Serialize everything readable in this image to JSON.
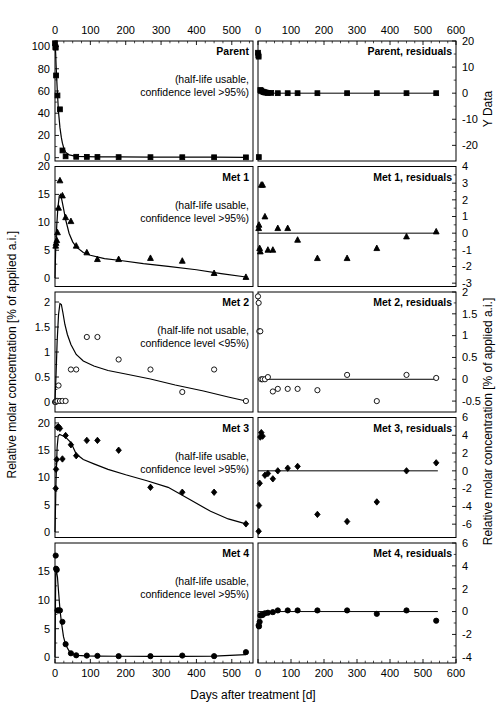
{
  "figure": {
    "xlabel": "Days after treatment [d]",
    "ylabel_left": "Relative molar concentration [% of applied a.i.]",
    "ylabel_right_top": "Y Data",
    "ylabel_right": "Relative molar concentration [% of applied a.i.]",
    "note_usable": "(half-life usable,",
    "note_usable2": "confidence level >95%)",
    "note_notusable": "(half-life not usable,",
    "note_notusable2": "confidence level <95%)",
    "xticks_left": [
      "0",
      "100",
      "200",
      "300",
      "400",
      "500"
    ],
    "xticks_right": [
      "0",
      "100",
      "200",
      "300",
      "400",
      "500",
      "600"
    ],
    "xlim_left": [
      0,
      560
    ],
    "xlim_right": [
      0,
      600
    ]
  },
  "chart_data": [
    {
      "type": "scatter",
      "id": "parent",
      "title": "Parent",
      "note": "(half-life usable, confidence level >95%)",
      "marker": "square",
      "filled": true,
      "xlabel": "Days after treatment [d]",
      "ylabel": "Relative molar concentration [% of applied a.i.]",
      "xlim": [
        0,
        560
      ],
      "ylim": [
        -3,
        105
      ],
      "yticks": [
        0,
        20,
        40,
        60,
        80,
        100
      ],
      "x": [
        0,
        1,
        2,
        3,
        7,
        14,
        21,
        30,
        60,
        90,
        120,
        180,
        270,
        360,
        450,
        540
      ],
      "y": [
        103,
        99.5,
        99,
        74,
        56,
        43.5,
        6.5,
        1.2,
        0.8,
        0.7,
        0.6,
        0.5,
        0.45,
        0.4,
        0.35,
        0.3
      ],
      "fit_x": [
        0,
        1,
        2,
        3,
        5,
        7,
        10,
        14,
        18,
        21,
        25,
        30,
        40,
        60,
        90,
        120,
        180,
        270,
        360,
        450,
        540
      ],
      "fit_y": [
        103,
        99,
        93,
        84,
        70,
        57,
        41,
        27,
        18,
        13,
        8.5,
        5,
        2.5,
        1.2,
        0.9,
        0.8,
        0.65,
        0.55,
        0.5,
        0.42,
        0.35
      ]
    },
    {
      "type": "scatter",
      "id": "parent-residuals",
      "title": "Parent, residuals",
      "marker": "square",
      "filled": true,
      "ylabel": "Y Data",
      "xlim": [
        0,
        600
      ],
      "ylim": [
        -26,
        20
      ],
      "yticks": [
        20,
        10,
        0,
        -10,
        -20
      ],
      "x": [
        0,
        1,
        2,
        2.5,
        7,
        10,
        14,
        18,
        21,
        25,
        30,
        40,
        60,
        90,
        120,
        180,
        270,
        360,
        450,
        540
      ],
      "y": [
        15.5,
        14.5,
        14,
        -24.5,
        1.2,
        1.0,
        0.6,
        0.4,
        0.3,
        0.2,
        0.1,
        0.1,
        0,
        0,
        0,
        0,
        0,
        0,
        0,
        0
      ],
      "zero_line": 0
    },
    {
      "type": "scatter",
      "id": "met1",
      "title": "Met 1",
      "note": "(half-life usable, confidence level >95%)",
      "marker": "triangle",
      "filled": true,
      "ylabel": "Relative molar concentration [% of applied a.i.]",
      "xlim": [
        0,
        560
      ],
      "ylim": [
        -1.5,
        20
      ],
      "yticks": [
        20,
        15,
        10,
        5,
        0
      ],
      "x": [
        2,
        3,
        5,
        7,
        10,
        14,
        21,
        30,
        45,
        60,
        90,
        120,
        180,
        270,
        360,
        450,
        540
      ],
      "y": [
        5.8,
        6.3,
        6.8,
        8.2,
        12.6,
        17.5,
        14.8,
        10.9,
        10.2,
        5.8,
        4.6,
        3.4,
        3.4,
        3.6,
        3.1,
        0.9,
        0.2
      ],
      "fit_x": [
        0,
        2,
        5,
        8,
        12,
        16,
        20,
        25,
        30,
        40,
        50,
        60,
        80,
        100,
        140,
        180,
        250,
        320,
        400,
        470,
        540
      ],
      "fit_y": [
        0,
        5.5,
        9.5,
        12.5,
        14.7,
        15.0,
        13.8,
        12.2,
        10.5,
        8.0,
        6.5,
        5.6,
        4.6,
        4.1,
        3.5,
        3.2,
        2.6,
        2.1,
        1.5,
        0.8,
        0.2
      ],
      "zero_line": 0
    },
    {
      "type": "scatter",
      "id": "met1-residuals",
      "title": "Met 1, residuals",
      "marker": "triangle",
      "filled": true,
      "xlim": [
        0,
        600
      ],
      "ylim": [
        -3.2,
        4
      ],
      "yticks": [
        4,
        3,
        2,
        1,
        0,
        -1,
        -2,
        -3
      ],
      "x": [
        2,
        3,
        5,
        7,
        10,
        14,
        21,
        30,
        45,
        60,
        90,
        120,
        180,
        270,
        360,
        450,
        540
      ],
      "y": [
        0.3,
        0.5,
        -0.9,
        -1.1,
        2.9,
        2.9,
        1.0,
        -1.0,
        -1.0,
        0.3,
        0.3,
        -0.4,
        -1.5,
        -1.5,
        -0.9,
        -0.2,
        0.1
      ],
      "zero_line": 0
    },
    {
      "type": "scatter",
      "id": "met2",
      "title": "Met 2",
      "note": "(half-life not usable, confidence level <95%)",
      "marker": "circle",
      "filled": false,
      "ylabel": "Relative molar concentration [% of applied a.i.]",
      "xlim": [
        0,
        560
      ],
      "ylim": [
        -0.2,
        2.2
      ],
      "yticks": [
        2.0,
        1.5,
        1.0,
        0.5,
        0.0
      ],
      "x": [
        0,
        2,
        4,
        7,
        10,
        14,
        21,
        30,
        45,
        60,
        90,
        120,
        180,
        270,
        360,
        450,
        540
      ],
      "y": [
        0.0,
        0.0,
        0.02,
        0.02,
        0.33,
        0.02,
        0.02,
        0.02,
        0.65,
        0.65,
        1.3,
        1.3,
        0.85,
        0.65,
        0.2,
        0.65,
        0.02
      ],
      "fit_x": [
        0,
        3,
        6,
        10,
        14,
        18,
        22,
        28,
        35,
        45,
        60,
        80,
        110,
        150,
        200,
        270,
        340,
        420,
        490,
        540
      ],
      "fit_y": [
        0.02,
        0.55,
        1.2,
        1.75,
        1.97,
        1.95,
        1.8,
        1.55,
        1.35,
        1.15,
        0.95,
        0.82,
        0.72,
        0.63,
        0.56,
        0.46,
        0.34,
        0.22,
        0.1,
        0.02
      ],
      "zero_line": 0
    },
    {
      "type": "scatter",
      "id": "met2-residuals",
      "title": "Met 2, residuals",
      "marker": "circle",
      "filled": false,
      "xlim": [
        0,
        600
      ],
      "ylim": [
        -0.75,
        2.0
      ],
      "yticks": [
        2.0,
        1.5,
        1.0,
        0.5,
        0.0,
        -0.5
      ],
      "x": [
        0,
        2,
        4,
        7,
        10,
        14,
        21,
        30,
        45,
        60,
        90,
        120,
        180,
        270,
        360,
        450,
        540
      ],
      "y": [
        1.9,
        1.75,
        1.1,
        1.1,
        0.0,
        0.0,
        0.0,
        0.05,
        -0.28,
        -0.22,
        -0.22,
        -0.22,
        -0.25,
        0.1,
        -0.5,
        0.1,
        0.03
      ],
      "zero_line": 0
    },
    {
      "type": "scatter",
      "id": "met3",
      "title": "Met 3",
      "note": "(half-life usable, confidence level >95%)",
      "marker": "diamond",
      "filled": true,
      "ylabel": "Relative molar concentration [% of applied a.i.]",
      "xlim": [
        0,
        560
      ],
      "ylim": [
        -1,
        21
      ],
      "yticks": [
        20,
        15,
        10,
        5,
        0
      ],
      "x": [
        2,
        3,
        5,
        7,
        10,
        14,
        21,
        30,
        45,
        60,
        90,
        120,
        180,
        270,
        360,
        450,
        540
      ],
      "y": [
        8.0,
        11.5,
        13.3,
        19.2,
        19.3,
        19.0,
        13.4,
        17.7,
        16.0,
        14.0,
        16.8,
        16.8,
        15.0,
        8.2,
        7.3,
        7.3,
        1.5
      ],
      "fit_x": [
        0,
        3,
        6,
        9,
        13,
        20,
        30,
        45,
        60,
        80,
        110,
        150,
        200,
        260,
        320,
        380,
        440,
        490,
        540
      ],
      "fit_y": [
        0,
        9.5,
        15.5,
        17.6,
        17.9,
        17.7,
        17.4,
        16.4,
        14.3,
        13.3,
        12.5,
        11.5,
        10.5,
        9.4,
        8.2,
        6.0,
        3.8,
        2.4,
        1.5
      ],
      "zero_line": 0
    },
    {
      "type": "scatter",
      "id": "met3-residuals",
      "title": "Met 3, residuals",
      "marker": "diamond",
      "filled": true,
      "xlim": [
        0,
        600
      ],
      "ylim": [
        -7.5,
        6
      ],
      "yticks": [
        6,
        4,
        2,
        0,
        -2,
        -4,
        -6
      ],
      "x": [
        2,
        3,
        5,
        7,
        10,
        14,
        21,
        30,
        45,
        60,
        90,
        120,
        180,
        270,
        360,
        450,
        540
      ],
      "y": [
        -6.8,
        -3.9,
        -1.4,
        3.8,
        4.3,
        3.9,
        -0.5,
        -0.3,
        -0.9,
        0.0,
        0.3,
        0.5,
        -4.9,
        -5.7,
        -3.5,
        0.0,
        0.9
      ],
      "zero_line": 0
    },
    {
      "type": "scatter",
      "id": "met4",
      "title": "Met 4",
      "note": "(half-life usable, confidence level >95%)",
      "marker": "circle",
      "filled": true,
      "ylabel": "Relative molar concentration [% of applied a.i.]",
      "xlim": [
        0,
        560
      ],
      "ylim": [
        -1,
        20
      ],
      "yticks": [
        15,
        10,
        5,
        0
      ],
      "x": [
        2,
        3,
        5,
        7,
        10,
        14,
        21,
        30,
        45,
        60,
        90,
        120,
        180,
        270,
        360,
        450,
        540
      ],
      "y": [
        17.8,
        15.5,
        15.3,
        8.2,
        8.2,
        8.2,
        6.2,
        2.3,
        0.7,
        0.35,
        0.3,
        0.25,
        0.2,
        0.2,
        0.3,
        0.2,
        0.9
      ],
      "fit_x": [
        0,
        2,
        4,
        7,
        10,
        14,
        18,
        24,
        30,
        40,
        50,
        65,
        85,
        120,
        180,
        270,
        360,
        450,
        540
      ],
      "fit_y": [
        0,
        14.5,
        15.2,
        14.0,
        11.5,
        8.4,
        6.2,
        3.6,
        2.2,
        1.1,
        0.6,
        0.35,
        0.25,
        0.2,
        0.18,
        0.17,
        0.17,
        0.2,
        0.45
      ],
      "zero_line": 0
    },
    {
      "type": "scatter",
      "id": "met4-residuals",
      "title": "Met 4, residuals",
      "marker": "circle",
      "filled": true,
      "xlim": [
        0,
        600
      ],
      "ylim": [
        -4.5,
        6
      ],
      "yticks": [
        6,
        4,
        2,
        0,
        -2,
        -4
      ],
      "x": [
        2,
        3,
        5,
        7,
        10,
        14,
        21,
        30,
        45,
        60,
        90,
        120,
        180,
        270,
        360,
        450,
        540
      ],
      "y": [
        -1.2,
        -1.3,
        -0.9,
        -0.35,
        -0.3,
        -0.3,
        -0.15,
        -0.1,
        -0.05,
        0.1,
        0.1,
        0.1,
        0.1,
        0.1,
        -0.2,
        0.1,
        -0.8
      ],
      "zero_line": 0
    }
  ]
}
